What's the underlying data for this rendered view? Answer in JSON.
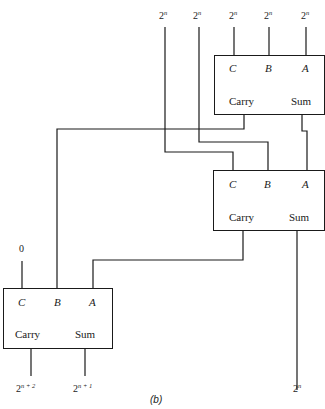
{
  "diagram": {
    "type": "full-adder cascade",
    "caption": "(b)",
    "top_inputs": [
      {
        "label_base": "2",
        "label_exp": "n"
      },
      {
        "label_base": "2",
        "label_exp": "n"
      },
      {
        "label_base": "2",
        "label_exp": "n"
      },
      {
        "label_base": "2",
        "label_exp": "n"
      },
      {
        "label_base": "2",
        "label_exp": "n"
      }
    ],
    "adders": [
      {
        "id": "adder-top",
        "inputs": [
          "C",
          "B",
          "A"
        ],
        "outputs": [
          "Carry",
          "Sum"
        ]
      },
      {
        "id": "adder-middle",
        "inputs": [
          "C",
          "B",
          "A"
        ],
        "outputs": [
          "Carry",
          "Sum"
        ]
      },
      {
        "id": "adder-bottom",
        "inputs": [
          "C",
          "B",
          "A"
        ],
        "outputs": [
          "Carry",
          "Sum"
        ]
      }
    ],
    "constant_input": "0",
    "outputs": [
      {
        "label_base": "2",
        "label_exp": "n + 2"
      },
      {
        "label_base": "2",
        "label_exp": "n + 1"
      },
      {
        "label_base": "2",
        "label_exp": "n"
      }
    ]
  }
}
